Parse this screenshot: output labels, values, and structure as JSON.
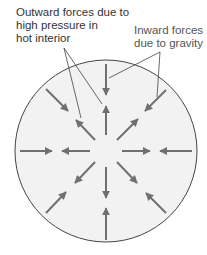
{
  "labels": {
    "outward": "Outward forces due to\nhigh pressure in\nhot interior",
    "inward": "Inward forces\ndue to gravity"
  },
  "diagram": {
    "circle": {
      "cx": 106,
      "cy": 151,
      "r": 91,
      "fill": "#f2f2f2",
      "stroke": "#444444"
    },
    "arrow_color": "#707070",
    "inward_arrows": 8,
    "outward_arrows": 8
  }
}
